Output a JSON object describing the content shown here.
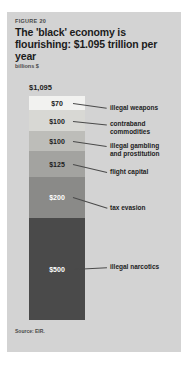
{
  "figure": {
    "number": "FIGURE 20",
    "title": "The 'black' economy is flourishing: $1.095 trillion per year",
    "units": "billions $",
    "source": "Source: EIR."
  },
  "chart_data": {
    "type": "bar",
    "title": "The 'black' economy is flourishing: $1.095 trillion per year",
    "subtitle": "FIGURE 20",
    "xlabel": "",
    "ylabel": "billions $",
    "orientation": "vertical-stacked",
    "total_label": "$1,095",
    "total_value": 1095,
    "grid": false,
    "legend": "right-callouts",
    "categories": [
      "illegal weapons",
      "contraband commodities",
      "illegal gambling and prostitution",
      "flight capital",
      "tax evasion",
      "illegal narcotics"
    ],
    "values": [
      70,
      100,
      100,
      125,
      200,
      500
    ],
    "value_labels": [
      "$70",
      "$100",
      "$100",
      "$125",
      "$200",
      "$500"
    ],
    "segments": [
      {
        "label": "illegal weapons",
        "value_label": "$70",
        "value": 70,
        "color": "#f2f2f0",
        "text_color": "#1c1c1c"
      },
      {
        "label": "contraband\ncommodities",
        "value_label": "$100",
        "value": 100,
        "color": "#d8d8d4",
        "text_color": "#1c1c1c"
      },
      {
        "label": "illegal gambling\nand prostitution",
        "value_label": "$100",
        "value": 100,
        "color": "#bdbdb9",
        "text_color": "#1c1c1c"
      },
      {
        "label": "flight capital",
        "value_label": "$125",
        "value": 125,
        "color": "#a3a3a0",
        "text_color": "#1c1c1c"
      },
      {
        "label": "tax evasion",
        "value_label": "$200",
        "value": 200,
        "color": "#8a8a88",
        "text_color": "#ffffff"
      },
      {
        "label": "illegal narcotics",
        "value_label": "$500",
        "value": 500,
        "color": "#4a4a4a",
        "text_color": "#ffffff"
      }
    ]
  }
}
